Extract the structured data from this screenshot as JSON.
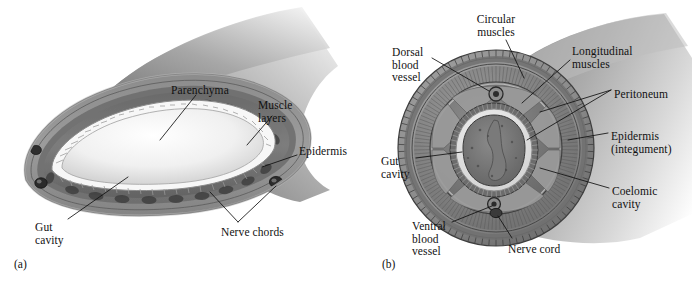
{
  "figure": {
    "background_color": "#ffffff",
    "ink_color": "#111111",
    "type": "two-panel biological cross-section diagram"
  },
  "panels": [
    {
      "id": "(a)",
      "id_x": 14,
      "id_y": 258,
      "subject": "acoelomate / parenchyma-filled worm body, cut-away longitudinal-oblique section",
      "labels": [
        {
          "name": "parenchyma",
          "text": "Parenchyma",
          "x": 171,
          "y": 84,
          "align": "left",
          "lines": [
            "Parenchyma"
          ]
        },
        {
          "name": "muscle-layers",
          "text": "Muscle layers",
          "x": 258,
          "y": 99,
          "align": "left",
          "lines": [
            "Muscle",
            "layers"
          ]
        },
        {
          "name": "epidermis",
          "text": "Epidermis",
          "x": 299,
          "y": 145,
          "align": "left",
          "lines": [
            "Epidermis"
          ]
        },
        {
          "name": "gut-cavity",
          "text": "Gut cavity",
          "x": 35,
          "y": 221,
          "align": "left",
          "lines": [
            "Gut",
            "cavity"
          ]
        },
        {
          "name": "nerve-chords",
          "text": "Nerve chords",
          "x": 221,
          "y": 226,
          "align": "left",
          "lines": [
            "Nerve chords"
          ]
        }
      ]
    },
    {
      "id": "(b)",
      "id_x": 382,
      "id_y": 258,
      "subject": "coelomate earthworm (annelid) transverse cross-section",
      "labels": [
        {
          "name": "circular-muscles",
          "text": "Circular muscles",
          "x": 496,
          "y": 13,
          "align": "center",
          "lines": [
            "Circular",
            "muscles"
          ]
        },
        {
          "name": "dorsal-blood-vessel",
          "text": "Dorsal blood vessel",
          "x": 392,
          "y": 46,
          "align": "left",
          "lines": [
            "Dorsal",
            "blood",
            "vessel"
          ]
        },
        {
          "name": "longitudinal-muscles",
          "text": "Longitudinal muscles",
          "x": 572,
          "y": 45,
          "align": "left",
          "lines": [
            "Longitudinal",
            "muscles"
          ]
        },
        {
          "name": "peritoneum",
          "text": "Peritoneum",
          "x": 614,
          "y": 88,
          "align": "left",
          "lines": [
            "Peritoneum"
          ]
        },
        {
          "name": "epidermis-integument",
          "text": "Epidermis (integument)",
          "x": 611,
          "y": 130,
          "align": "left",
          "lines": [
            "Epidermis",
            "(integument)"
          ]
        },
        {
          "name": "gut-cavity-b",
          "text": "Gut cavity",
          "x": 381,
          "y": 155,
          "align": "left",
          "lines": [
            "Gut",
            "cavity"
          ]
        },
        {
          "name": "coelomic-cavity",
          "text": "Coelomic cavity",
          "x": 612,
          "y": 185,
          "align": "left",
          "lines": [
            "Coelomic",
            "cavity"
          ]
        },
        {
          "name": "ventral-blood-vessel",
          "text": "Ventral blood vessel",
          "x": 412,
          "y": 220,
          "align": "left",
          "lines": [
            "Ventral",
            "blood",
            "vessel"
          ]
        },
        {
          "name": "nerve-cord",
          "text": "Nerve cord",
          "x": 508,
          "y": 243,
          "align": "left",
          "lines": [
            "Nerve cord"
          ]
        }
      ]
    }
  ]
}
